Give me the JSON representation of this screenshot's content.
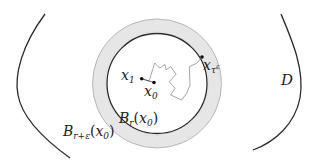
{
  "diagram": {
    "domain_label": "D",
    "inner_ball": {
      "base": "B",
      "sub": "r",
      "arg_var": "x",
      "arg_sub": "0"
    },
    "outer_ball": {
      "base": "B",
      "sub": "r+ε",
      "arg_var": "x",
      "arg_sub": "0"
    },
    "point_x1": {
      "var": "x",
      "sub": "1"
    },
    "point_x0": {
      "var": "x",
      "sub": "0"
    },
    "point_exit": {
      "var": "x",
      "sub": "τ",
      "sup": "ε"
    },
    "colors": {
      "stroke": "#2a2a2a",
      "ring": "#e3e3e3",
      "ring_edge": "#9a9a9a",
      "path": "#8c8c8c"
    }
  }
}
